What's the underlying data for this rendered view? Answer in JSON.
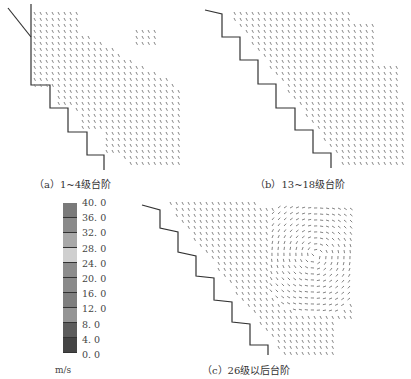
{
  "figure": {
    "panels": [
      {
        "id": "a",
        "caption": "（a）1~4级台阶"
      },
      {
        "id": "b",
        "caption": "（b）13~18级台阶"
      },
      {
        "id": "c",
        "caption": "（c）26级以后台阶"
      }
    ],
    "colorbar": {
      "unit": "m/s",
      "labels": [
        "40. 0",
        "36. 0",
        "32. 0",
        "28. 0",
        "24. 0",
        "20. 0",
        "16. 0",
        "12. 0",
        "8. 0",
        "4. 0",
        "0. 0"
      ],
      "colors": [
        "#7a7a7a",
        "#8a8a8a",
        "#a8a8a8",
        "#cfcfcf",
        "#8c8c8c",
        "#8a8a8a",
        "#7e7e7e",
        "#959595",
        "#5c5c5c",
        "#444444"
      ]
    },
    "vector_color": "#777777",
    "step_color": "#333333"
  }
}
